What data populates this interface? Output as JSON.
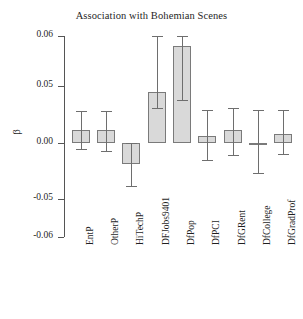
{
  "chart_data": {
    "type": "bar",
    "title": "Association with Bohemian Scenes",
    "xlabel": "",
    "ylabel": "β",
    "ylim": [
      -0.06,
      0.06
    ],
    "grid": false,
    "legend": null,
    "ytick_labels": [
      "0.06",
      "0.05",
      "0.00",
      "-0.05",
      "-0.06"
    ],
    "ytick_values": [
      0.06,
      0.05,
      0.0,
      -0.05,
      -0.06
    ],
    "categories": [
      "EntP",
      "OtherP",
      "HiTechP",
      "DFJobs9401",
      "DfPop",
      "DfPCI",
      "DfGRent",
      "DfCollege",
      "DfGradProf"
    ],
    "values": [
      0.011,
      0.011,
      -0.019,
      0.045,
      0.058,
      0.006,
      0.011,
      -0.0005,
      0.008
    ],
    "error_low": [
      -0.005,
      -0.007,
      -0.038,
      0.031,
      0.038,
      -0.015,
      -0.011,
      -0.027,
      -0.01
    ],
    "error_high": [
      0.028,
      0.028,
      0.0,
      0.061,
      0.071,
      0.029,
      0.031,
      0.029,
      0.029
    ],
    "bar_fill_color": "#d9d9d9",
    "bar_edge_color": "#7a7a7a",
    "error_bar_color": "#6e6e6e",
    "axis_color": "#555555"
  }
}
